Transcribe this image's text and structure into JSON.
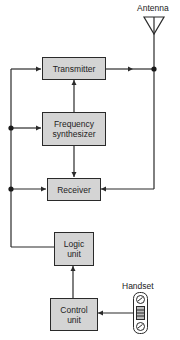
{
  "diagram": {
    "antenna_label": "Antenna",
    "handset_label": "Handset",
    "blocks": {
      "transmitter": "Transmitter",
      "synth_line1": "Frequency",
      "synth_line2": "synthesizer",
      "receiver": "Receiver",
      "logic_line1": "Logic",
      "logic_line2": "unit",
      "control_line1": "Control",
      "control_line2": "unit"
    },
    "colors": {
      "box_fill": "#d4d4d4",
      "line": "#2a2a2a"
    }
  }
}
